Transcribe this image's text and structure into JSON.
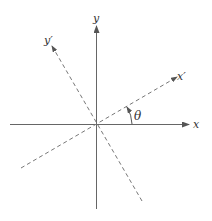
{
  "diagram": {
    "title": "",
    "axes": {
      "x_label": "x",
      "y_label": "y",
      "x_prime_label": "x′",
      "y_prime_label": "y′",
      "angle_label": "θ"
    },
    "colors": {
      "axis": "#555555",
      "rotated_axis": "#666666",
      "text": "#333333"
    }
  }
}
